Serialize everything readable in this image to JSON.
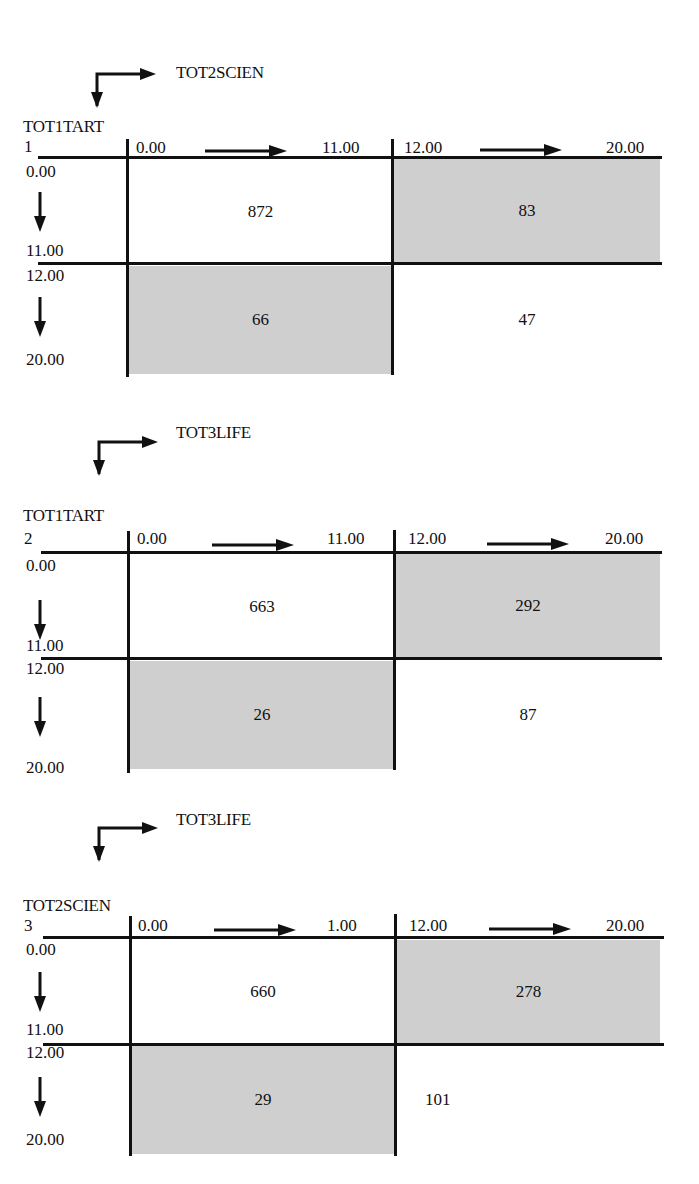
{
  "panels": [
    {
      "table_number": "1",
      "column_variable": "TOT2SCIEN",
      "row_variable": "TOT1TART",
      "column_ranges": [
        {
          "from": "0.00",
          "to": "11.00"
        },
        {
          "from": "12.00",
          "to": "20.00"
        }
      ],
      "row_ranges": [
        {
          "from": "0.00",
          "to": "11.00"
        },
        {
          "from": "12.00",
          "to": "20.00"
        }
      ],
      "cells": [
        [
          "872",
          "83"
        ],
        [
          "66",
          "47"
        ]
      ]
    },
    {
      "table_number": "2",
      "column_variable": "TOT3LIFE",
      "row_variable": "TOT1TART",
      "column_ranges": [
        {
          "from": "0.00",
          "to": "11.00"
        },
        {
          "from": "12.00",
          "to": "20.00"
        }
      ],
      "row_ranges": [
        {
          "from": "0.00",
          "to": "11.00"
        },
        {
          "from": "12.00",
          "to": "20.00"
        }
      ],
      "cells": [
        [
          "663",
          "292"
        ],
        [
          "26",
          "87"
        ]
      ]
    },
    {
      "table_number": "3",
      "column_variable": "TOT3LIFE",
      "row_variable": "TOT2SCIEN",
      "column_ranges": [
        {
          "from": "0.00",
          "to": "1.00"
        },
        {
          "from": "12.00",
          "to": "20.00"
        }
      ],
      "row_ranges": [
        {
          "from": "0.00",
          "to": "11.00"
        },
        {
          "from": "12.00",
          "to": "20.00"
        }
      ],
      "cells": [
        [
          "660",
          "278"
        ],
        [
          "29",
          "101"
        ]
      ]
    }
  ],
  "colors": {
    "shaded_cell": "#cfcfcf",
    "line": "#111111",
    "background": "#ffffff"
  }
}
